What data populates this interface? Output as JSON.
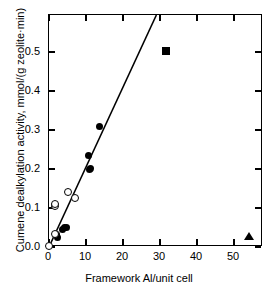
{
  "chart_data": {
    "type": "scatter",
    "title": "",
    "xlabel": "Framework Al/unit cell",
    "ylabel": "Cumene dealkylation activity, mmol/(g zeolite·min)",
    "xlim": [
      0,
      57.8
    ],
    "ylim": [
      0,
      0.595
    ],
    "xticks": [
      0,
      10,
      20,
      30,
      40,
      50
    ],
    "xticklabels": [
      "0",
      "10",
      "20",
      "30",
      "40",
      "50"
    ],
    "yticks": [
      0.0,
      0.1,
      0.2,
      0.3,
      0.4,
      0.5
    ],
    "yticklabels": [
      "0.0",
      "0.1",
      "0.2",
      "0.3",
      "0.4",
      "0.5"
    ],
    "grid": false,
    "legend": "none",
    "frame": "full-box",
    "tick_direction": "in",
    "series": [
      {
        "name": "filled-circles",
        "marker": "filled-circle",
        "color": "#000000",
        "points": [
          {
            "x": 1.9,
            "y": 0.031
          },
          {
            "x": 2.3,
            "y": 0.024
          },
          {
            "x": 3.6,
            "y": 0.046
          },
          {
            "x": 4.2,
            "y": 0.049
          },
          {
            "x": 4.8,
            "y": 0.05
          },
          {
            "x": 10.8,
            "y": 0.234
          },
          {
            "x": 10.9,
            "y": 0.199
          },
          {
            "x": 11.3,
            "y": 0.201
          },
          {
            "x": 13.6,
            "y": 0.309
          }
        ]
      },
      {
        "name": "open-circles",
        "marker": "open-circle",
        "color": "#000000",
        "points": [
          {
            "x": 0.1,
            "y": 0.002
          },
          {
            "x": 1.6,
            "y": 0.033
          },
          {
            "x": 1.7,
            "y": 0.104
          },
          {
            "x": 1.8,
            "y": 0.11
          },
          {
            "x": 5.3,
            "y": 0.14
          },
          {
            "x": 7.0,
            "y": 0.125
          }
        ]
      },
      {
        "name": "filled-square",
        "marker": "filled-square",
        "color": "#000000",
        "points": [
          {
            "x": 31.6,
            "y": 0.502
          }
        ]
      },
      {
        "name": "filled-triangle",
        "marker": "filled-triangle",
        "color": "#000000",
        "points": [
          {
            "x": 54.0,
            "y": 0.029
          }
        ]
      }
    ],
    "trendline": {
      "name": "linear-fit",
      "x_start": 0.0,
      "y_start": 0.0,
      "x_end": 29.0,
      "y_end": 0.595,
      "slope": 0.02052,
      "intercept": 0.0,
      "color": "#000000"
    }
  }
}
